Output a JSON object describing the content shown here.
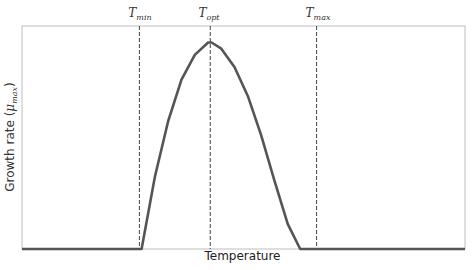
{
  "chart_data": {
    "type": "line",
    "title": "",
    "xlabel": "Temperature",
    "ylabel": "Growth rate (μmax)",
    "ylabel_parts": {
      "main": "Growth rate (",
      "symbol": "μ",
      "sub": "max",
      "close": ")"
    },
    "x_ticks": [],
    "y_ticks": [],
    "grid": false,
    "legend": null,
    "xlim": [
      0,
      100
    ],
    "ylim": [
      0,
      1.08
    ],
    "series": [
      {
        "name": "Growth rate",
        "color": "#555555",
        "x": [
          0,
          27,
          30,
          33,
          36,
          39,
          42,
          42.8,
          45,
          48,
          51,
          54,
          57,
          60,
          62.8,
          100
        ],
        "y": [
          0,
          0,
          0.35,
          0.62,
          0.82,
          0.94,
          1.0,
          1.0,
          0.97,
          0.88,
          0.74,
          0.55,
          0.33,
          0.12,
          0,
          0
        ]
      }
    ],
    "annotations": [
      {
        "type": "vline",
        "x": 26.5,
        "label": "T",
        "sub": "min",
        "style": "dashed"
      },
      {
        "type": "vline",
        "x": 42.5,
        "label": "T",
        "sub": "opt",
        "style": "dashed"
      },
      {
        "type": "vline",
        "x": 66.5,
        "label": "T",
        "sub": "max",
        "style": "dashed"
      }
    ]
  },
  "labels": {
    "xlabel": "Temperature",
    "ylabel_main": "Growth rate (",
    "ylabel_symbol": "μ",
    "ylabel_sub": "max",
    "ylabel_close": ")",
    "tmin_main": "T",
    "tmin_sub": "min",
    "topt_main": "T",
    "topt_sub": "opt",
    "tmax_main": "T",
    "tmax_sub": "max"
  },
  "colors": {
    "curve": "#555555",
    "spine": "#bbbbbb",
    "vline": "#444444"
  }
}
